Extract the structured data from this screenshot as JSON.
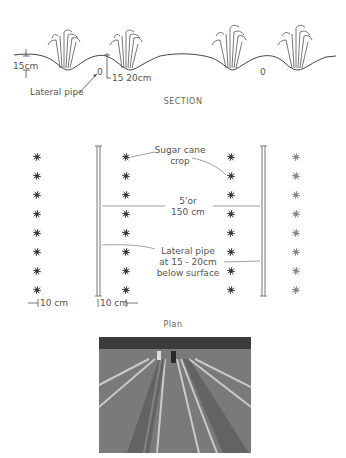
{
  "section": {
    "caption": "SECTION",
    "labels": {
      "depth_ridge": "15cm",
      "pipe_depth": "15 20cm",
      "lateral_pipe": "Lateral pipe",
      "pipe_marker_left": "0",
      "pipe_marker_right": "0"
    }
  },
  "plan": {
    "caption": "Plan",
    "labels": {
      "crop_line1": "Sugar cane",
      "crop_line2": "crop",
      "spacing_line1": "5'or",
      "spacing_line2": "150 cm",
      "pipe_line1": "Lateral pipe",
      "pipe_line2": "at 15 - 20cm",
      "pipe_line3": "below surface",
      "offset_left": "10 cm",
      "offset_right": "10 cm"
    },
    "plant_columns_x": [
      37,
      126,
      231,
      296
    ],
    "plant_rows_y": [
      157,
      176,
      195,
      214,
      233,
      252,
      271,
      290
    ],
    "pipe_columns_x": [
      98,
      263
    ]
  },
  "photo": {
    "description": "field-furrows-photo"
  }
}
